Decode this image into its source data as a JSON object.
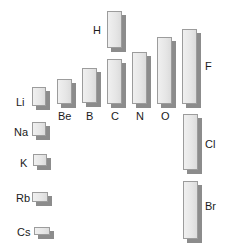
{
  "colors": {
    "bar_fill": "#e8e8e8",
    "bar_border": "#9c9c9c",
    "shadow": "#8c8c8c",
    "label": "#1a1a1a"
  },
  "elements": [
    {
      "symbol": "H",
      "x": 107,
      "y": 11,
      "w": 15,
      "h": 37
    },
    {
      "symbol": "Li",
      "x": 32,
      "y": 87,
      "w": 14,
      "h": 19
    },
    {
      "symbol": "Be",
      "x": 57,
      "y": 79,
      "w": 15,
      "h": 25
    },
    {
      "symbol": "B",
      "x": 82,
      "y": 68,
      "w": 15,
      "h": 35
    },
    {
      "symbol": "C",
      "x": 107,
      "y": 59,
      "w": 15,
      "h": 45
    },
    {
      "symbol": "N",
      "x": 132,
      "y": 52,
      "w": 15,
      "h": 52
    },
    {
      "symbol": "O",
      "x": 157,
      "y": 37,
      "w": 15,
      "h": 67
    },
    {
      "symbol": "F",
      "x": 182,
      "y": 29,
      "w": 15,
      "h": 75
    },
    {
      "symbol": "Na",
      "x": 32,
      "y": 122,
      "w": 14,
      "h": 14
    },
    {
      "symbol": "K",
      "x": 33,
      "y": 154,
      "w": 14,
      "h": 12
    },
    {
      "symbol": "Rb",
      "x": 32,
      "y": 192,
      "w": 16,
      "h": 10
    },
    {
      "symbol": "Cs",
      "x": 34,
      "y": 227,
      "w": 16,
      "h": 8
    },
    {
      "symbol": "Cl",
      "x": 183,
      "y": 114,
      "w": 15,
      "h": 56
    },
    {
      "symbol": "Br",
      "x": 183,
      "y": 181,
      "w": 15,
      "h": 58
    }
  ],
  "labels": [
    {
      "text": "H",
      "x": 93,
      "y": 24
    },
    {
      "text": "Li",
      "x": 16,
      "y": 96
    },
    {
      "text": "Be",
      "x": 58,
      "y": 110
    },
    {
      "text": "B",
      "x": 86,
      "y": 110
    },
    {
      "text": "C",
      "x": 111,
      "y": 110
    },
    {
      "text": "N",
      "x": 136,
      "y": 110
    },
    {
      "text": "O",
      "x": 161,
      "y": 110
    },
    {
      "text": "F",
      "x": 205,
      "y": 60
    },
    {
      "text": "Na",
      "x": 14,
      "y": 126
    },
    {
      "text": "K",
      "x": 20,
      "y": 157
    },
    {
      "text": "Rb",
      "x": 16,
      "y": 192
    },
    {
      "text": "Cs",
      "x": 17,
      "y": 226
    },
    {
      "text": "Cl",
      "x": 205,
      "y": 138
    },
    {
      "text": "Br",
      "x": 205,
      "y": 200
    }
  ]
}
